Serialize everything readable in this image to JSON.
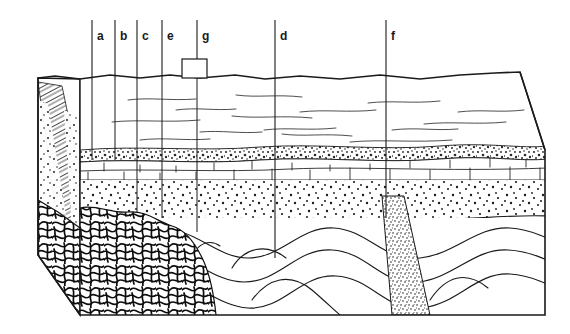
{
  "figure": {
    "type": "geologic-block-diagram",
    "title": "",
    "background_color": "#ffffff",
    "line_color": "#1a1a1a",
    "label_color": "#1a1a1a"
  },
  "call_lines": [
    {
      "id": "a",
      "label": "a",
      "x": 92,
      "label_x": 97,
      "y_top": 20,
      "y_bottom": 80,
      "has_box": false
    },
    {
      "id": "b",
      "label": "b",
      "x": 115,
      "label_x": 120,
      "y_top": 20,
      "y_bottom": 80,
      "has_box": false
    },
    {
      "id": "c",
      "label": "c",
      "x": 137,
      "label_x": 142,
      "y_top": 20,
      "y_bottom": 80,
      "has_box": false
    },
    {
      "id": "e",
      "label": "e",
      "x": 162,
      "label_x": 167,
      "y_top": 20,
      "y_bottom": 80,
      "has_box": false
    },
    {
      "id": "g",
      "label": "g",
      "x": 197,
      "label_x": 202,
      "y_top": 20,
      "y_bottom": 59,
      "has_box": true
    },
    {
      "id": "d",
      "label": "d",
      "x": 275,
      "label_x": 280,
      "y_top": 20,
      "y_bottom": 258,
      "has_box": false
    },
    {
      "id": "f",
      "label": "f",
      "x": 386,
      "label_x": 391,
      "y_top": 20,
      "y_bottom": 218,
      "has_box": false
    }
  ],
  "callout_box": {
    "x": 182,
    "y": 59,
    "width": 25,
    "height": 19
  },
  "deep_lines": [
    {
      "id": "c-deep",
      "x": 137,
      "y_top": 80,
      "y_bottom": 212
    },
    {
      "id": "e-deep",
      "x": 162,
      "y_top": 80,
      "y_bottom": 218
    },
    {
      "id": "a-deep",
      "x": 92,
      "y_top": 80,
      "y_bottom": 160
    },
    {
      "id": "b-deep",
      "x": 115,
      "y_top": 80,
      "y_bottom": 160
    },
    {
      "id": "g-deep",
      "x": 197,
      "y_top": 78,
      "y_bottom": 232
    }
  ],
  "units": [
    {
      "name": "shale-siltstone",
      "label": "",
      "pattern": "horizontal-dashes",
      "top": 77,
      "bottom": 148
    },
    {
      "name": "conglomerate",
      "label": "",
      "pattern": "coarse-stipple",
      "top": 148,
      "bottom": 158
    },
    {
      "name": "limestone",
      "label": "",
      "pattern": "brick",
      "top": 158,
      "bottom": 180
    },
    {
      "name": "sandstone",
      "label": "",
      "pattern": "fine-stipple",
      "top": 180,
      "bottom": 222
    },
    {
      "name": "folded-strata",
      "label": "",
      "pattern": "folded-beds",
      "top": 222,
      "bottom": 315
    },
    {
      "name": "metamorphic-basement",
      "label": "",
      "pattern": "swirl-schist",
      "top": 200,
      "bottom": 315
    },
    {
      "name": "dike",
      "label": "",
      "pattern": "dense-stipple",
      "top": 196,
      "bottom": 315
    },
    {
      "name": "cross-bedded-sand",
      "label": "",
      "pattern": "diagonal-hatch",
      "top": 85,
      "bottom": 300
    }
  ],
  "block": {
    "top_back_left": [
      38,
      78
    ],
    "top_back_right": [
      520,
      72
    ],
    "top_front_right": [
      545,
      150
    ],
    "front_left": [
      80,
      315
    ],
    "bottom_right": [
      545,
      315
    ]
  }
}
